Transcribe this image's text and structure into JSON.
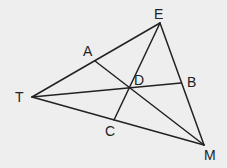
{
  "background": "#eeeeee",
  "stroke_color": "#222222",
  "points": {
    "E": {
      "label": "E",
      "x": 160,
      "y": 23,
      "lx": 154,
      "ly": 19
    },
    "T": {
      "label": "T",
      "x": 32,
      "y": 97,
      "lx": 15,
      "ly": 102
    },
    "M": {
      "label": "M",
      "x": 204,
      "y": 145,
      "lx": 204,
      "ly": 160
    },
    "A": {
      "label": "A",
      "x": 95,
      "y": 61,
      "lx": 83,
      "ly": 56
    },
    "B": {
      "label": "B",
      "x": 181,
      "y": 83,
      "lx": 187,
      "ly": 87
    },
    "C": {
      "label": "C",
      "x": 114,
      "y": 120,
      "lx": 105,
      "ly": 136
    },
    "D": {
      "label": "D",
      "x": 128,
      "y": 89,
      "lx": 134,
      "ly": 85
    }
  },
  "segments": [
    [
      "T",
      "E"
    ],
    [
      "E",
      "M"
    ],
    [
      "T",
      "M"
    ],
    [
      "A",
      "M"
    ],
    [
      "T",
      "B"
    ],
    [
      "E",
      "C"
    ]
  ]
}
